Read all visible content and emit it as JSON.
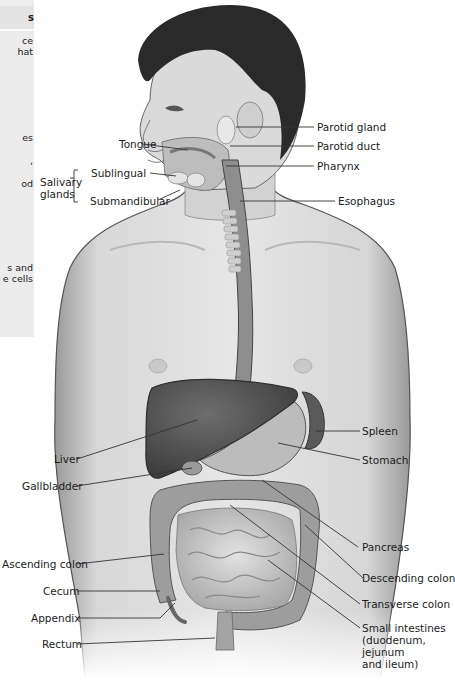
{
  "sidebar": {
    "header_fragment": "s",
    "fragments": [
      {
        "text": "ce\nhat",
        "top": 35
      },
      {
        "text": "es",
        "top": 132
      },
      {
        "text": ",",
        "top": 155
      },
      {
        "text": "od",
        "top": 178
      },
      {
        "text": "s and\ne cells",
        "top": 262
      }
    ]
  },
  "labels": {
    "tongue": "Tongue",
    "salivary_glands": "Salivary\nglands",
    "sublingual": "Sublingual",
    "submandibular": "Submandibular",
    "parotid_gland": "Parotid gland",
    "parotid_duct": "Parotid duct",
    "pharynx": "Pharynx",
    "esophagus": "Esophagus",
    "liver": "Liver",
    "gallbladder": "Gallbladder",
    "spleen": "Spleen",
    "stomach": "Stomach",
    "pancreas": "Pancreas",
    "ascending_colon": "Ascending colon",
    "descending_colon": "Descending colon",
    "cecum": "Cecum",
    "transverse_colon": "Transverse colon",
    "appendix": "Appendix",
    "small_intestines": "Small intestines\n(duodenum,\njejunum\nand ileum)",
    "rectum": "Rectum"
  },
  "colors": {
    "skin": "#dcdcdc",
    "hair": "#2a2a2a",
    "organ_dark": "#5a5a5a",
    "organ_mid": "#8c8c8c",
    "intestine": "#c4c4c4",
    "leader_line": "#333333"
  }
}
